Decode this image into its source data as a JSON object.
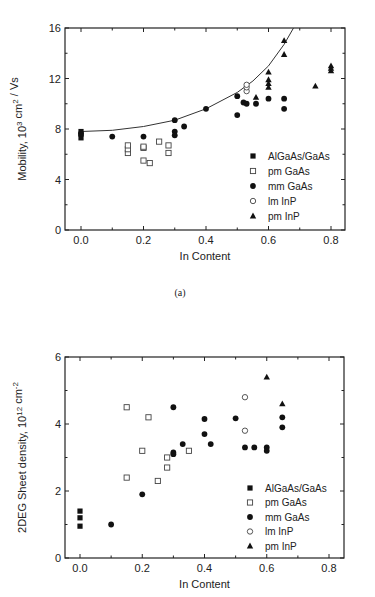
{
  "chart_data": [
    {
      "type": "scatter",
      "panel_caption": "(a)",
      "title": "",
      "xlabel": "In Content",
      "ylabel": "Mobility, 10^3 cm^2 / Vs",
      "xlim": [
        -0.05,
        0.85
      ],
      "ylim": [
        0,
        16
      ],
      "xticks": [
        "0.0",
        "0.2",
        "0.4",
        "0.6",
        "0.8"
      ],
      "yticks": [
        "0",
        "4",
        "8",
        "12",
        "16"
      ],
      "grid": false,
      "legend_position": "lower right",
      "fit_curve": {
        "description": "exponential-like fit through mm GaAs upper envelope",
        "points": [
          [
            0.0,
            7.8
          ],
          [
            0.1,
            7.9
          ],
          [
            0.2,
            8.2
          ],
          [
            0.3,
            8.7
          ],
          [
            0.4,
            9.6
          ],
          [
            0.5,
            10.9
          ],
          [
            0.55,
            11.8
          ],
          [
            0.6,
            13.0
          ],
          [
            0.65,
            14.7
          ],
          [
            0.68,
            16.0
          ]
        ]
      },
      "series": [
        {
          "name": "AlGaAs/GaAs",
          "marker": "filled-square",
          "points": [
            [
              0.0,
              7.3
            ],
            [
              0.0,
              7.6
            ],
            [
              0.0,
              7.8
            ]
          ]
        },
        {
          "name": "pm GaAs",
          "marker": "open-square",
          "points": [
            [
              0.15,
              6.1
            ],
            [
              0.15,
              6.4
            ],
            [
              0.15,
              6.7
            ],
            [
              0.2,
              6.5
            ],
            [
              0.2,
              6.6
            ],
            [
              0.2,
              5.5
            ],
            [
              0.22,
              5.3
            ],
            [
              0.25,
              7.0
            ],
            [
              0.28,
              6.7
            ],
            [
              0.28,
              6.1
            ]
          ]
        },
        {
          "name": "mm GaAs",
          "marker": "filled-circle",
          "points": [
            [
              0.0,
              7.6
            ],
            [
              0.1,
              7.4
            ],
            [
              0.2,
              7.4
            ],
            [
              0.3,
              8.7
            ],
            [
              0.3,
              7.8
            ],
            [
              0.3,
              7.5
            ],
            [
              0.33,
              8.2
            ],
            [
              0.4,
              9.6
            ],
            [
              0.5,
              10.6
            ],
            [
              0.5,
              9.1
            ],
            [
              0.52,
              10.1
            ],
            [
              0.53,
              10.0
            ],
            [
              0.56,
              10.0
            ],
            [
              0.6,
              10.4
            ],
            [
              0.65,
              10.4
            ],
            [
              0.65,
              9.6
            ]
          ]
        },
        {
          "name": "lm InP",
          "marker": "open-circle",
          "points": [
            [
              0.53,
              11.0
            ],
            [
              0.53,
              11.3
            ],
            [
              0.53,
              11.5
            ]
          ]
        },
        {
          "name": "pm InP",
          "marker": "filled-triangle",
          "points": [
            [
              0.56,
              10.5
            ],
            [
              0.6,
              11.3
            ],
            [
              0.6,
              11.6
            ],
            [
              0.6,
              11.9
            ],
            [
              0.6,
              12.5
            ],
            [
              0.65,
              13.9
            ],
            [
              0.65,
              15.0
            ],
            [
              0.75,
              11.4
            ],
            [
              0.8,
              12.6
            ],
            [
              0.8,
              12.8
            ],
            [
              0.8,
              13.0
            ]
          ]
        }
      ]
    },
    {
      "type": "scatter",
      "panel_caption": "",
      "title": "",
      "xlabel": "In Content",
      "ylabel": "2DEG Sheet density, 10^12 cm^-2",
      "xlim": [
        -0.05,
        0.85
      ],
      "ylim": [
        0,
        6
      ],
      "xticks": [
        "0.0",
        "0.2",
        "0.4",
        "0.6",
        "0.8"
      ],
      "yticks": [
        "0",
        "2",
        "4",
        "6"
      ],
      "grid": false,
      "legend_position": "lower right",
      "series": [
        {
          "name": "AlGaAs/GaAs",
          "marker": "filled-square",
          "points": [
            [
              0.0,
              0.95
            ],
            [
              0.0,
              1.2
            ],
            [
              0.0,
              1.4
            ]
          ]
        },
        {
          "name": "pm GaAs",
          "marker": "open-square",
          "points": [
            [
              0.15,
              4.5
            ],
            [
              0.15,
              2.4
            ],
            [
              0.2,
              3.2
            ],
            [
              0.22,
              4.2
            ],
            [
              0.25,
              2.3
            ],
            [
              0.28,
              2.7
            ],
            [
              0.28,
              3.0
            ],
            [
              0.35,
              3.2
            ]
          ]
        },
        {
          "name": "mm GaAs",
          "marker": "filled-circle",
          "points": [
            [
              0.1,
              1.0
            ],
            [
              0.2,
              1.9
            ],
            [
              0.3,
              4.5
            ],
            [
              0.3,
              3.15
            ],
            [
              0.3,
              3.1
            ],
            [
              0.33,
              3.4
            ],
            [
              0.4,
              4.15
            ],
            [
              0.4,
              3.7
            ],
            [
              0.42,
              3.4
            ],
            [
              0.5,
              4.17
            ],
            [
              0.53,
              3.3
            ],
            [
              0.56,
              3.3
            ],
            [
              0.6,
              3.3
            ],
            [
              0.6,
              3.2
            ],
            [
              0.65,
              4.2
            ],
            [
              0.65,
              3.9
            ]
          ]
        },
        {
          "name": "lm InP",
          "marker": "open-circle",
          "points": [
            [
              0.53,
              4.8
            ],
            [
              0.53,
              3.8
            ]
          ]
        },
        {
          "name": "pm InP",
          "marker": "filled-triangle",
          "points": [
            [
              0.6,
              5.4
            ],
            [
              0.65,
              4.6
            ]
          ]
        }
      ]
    }
  ],
  "legend": {
    "entries": [
      "AlGaAs/GaAs",
      "pm GaAs",
      "mm GaAs",
      "lm InP",
      "pm InP"
    ]
  },
  "panel_a": {
    "caption": "(a)",
    "xlabel": "In Content",
    "ylabel_main": "Mobility, 10",
    "ylabel_sup1": "3",
    "ylabel_mid": " cm",
    "ylabel_sup2": "2",
    "ylabel_end": " / Vs",
    "yticks": [
      "0",
      "4",
      "8",
      "12",
      "16"
    ],
    "xticks": [
      "0.0",
      "0.2",
      "0.4",
      "0.6",
      "0.8"
    ]
  },
  "panel_b": {
    "xlabel": "In Content",
    "ylabel_main": "2DEG Sheet density, 10",
    "ylabel_sup1": "12",
    "ylabel_mid": " cm",
    "ylabel_sup2": "-2",
    "yticks": [
      "0",
      "2",
      "4",
      "6"
    ],
    "xticks": [
      "0.0",
      "0.2",
      "0.4",
      "0.6",
      "0.8"
    ]
  }
}
